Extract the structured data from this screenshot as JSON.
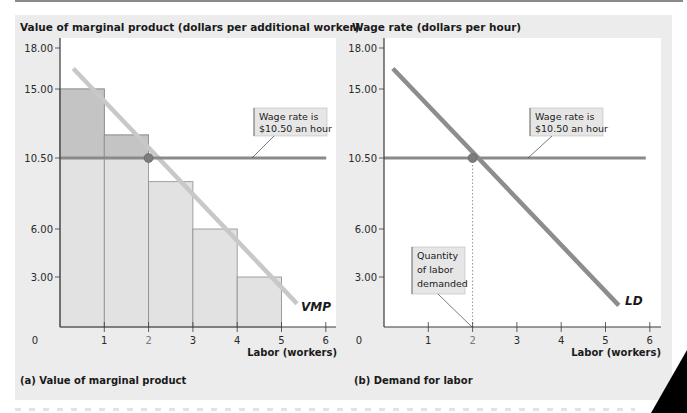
{
  "chart_data": [
    {
      "type": "bar",
      "panel_caption": "(a) Value of marginal product",
      "ylabel": "Value of marginal product (dollars per additional worker)",
      "xlabel": "Labor (workers)",
      "x_ticks": [
        "0",
        "1",
        "2",
        "3",
        "4",
        "5",
        "6"
      ],
      "y_ticks": [
        "3.00",
        "6.00",
        "10.50",
        "15.00",
        "18.00"
      ],
      "y_tick_values": [
        3,
        6,
        10.5,
        15,
        18
      ],
      "xlim": [
        0,
        6
      ],
      "ylim": [
        0,
        18
      ],
      "bars": {
        "x_start": [
          0,
          1,
          2,
          3,
          4
        ],
        "x_end": [
          1,
          2,
          3,
          4,
          5
        ],
        "values": [
          15,
          12,
          9,
          6,
          3
        ]
      },
      "series": [
        {
          "name": "VMP",
          "type": "line",
          "x": [
            0.3,
            5.35
          ],
          "y": [
            16.5,
            1.4
          ]
        },
        {
          "name": "Wage rate",
          "type": "hline",
          "y": 10.5,
          "x": [
            0,
            6.1
          ]
        }
      ],
      "equilibrium": {
        "x": 2,
        "y": 10.5
      },
      "annotations": [
        {
          "text_lines": [
            "Wage rate is",
            "$10.50 an hour"
          ],
          "points_to": {
            "x": 3.3,
            "y": 10.5
          }
        }
      ],
      "curve_label": "VMP"
    },
    {
      "type": "line",
      "panel_caption": "(b) Demand for labor",
      "ylabel": "Wage rate (dollars per hour)",
      "xlabel": "Labor (workers)",
      "x_ticks": [
        "0",
        "1",
        "2",
        "3",
        "4",
        "5",
        "6"
      ],
      "y_ticks": [
        "3.00",
        "6.00",
        "10.50",
        "15.00",
        "18.00"
      ],
      "y_tick_values": [
        3,
        6,
        10.5,
        15,
        18
      ],
      "xlim": [
        0,
        6
      ],
      "ylim": [
        0,
        18
      ],
      "series": [
        {
          "name": "LD",
          "type": "line",
          "x": [
            0.2,
            5.3
          ],
          "y": [
            16.5,
            1.3
          ]
        },
        {
          "name": "Wage rate",
          "type": "hline",
          "y": 10.5,
          "x": [
            0,
            6
          ]
        }
      ],
      "equilibrium": {
        "x": 2,
        "y": 10.5
      },
      "annotations": [
        {
          "text_lines": [
            "Wage rate is",
            "$10.50 an hour"
          ],
          "points_to": {
            "x": 3.3,
            "y": 10.5
          }
        },
        {
          "text_lines": [
            "Quantity",
            "of labor",
            "demanded"
          ],
          "points_to": {
            "x": 2,
            "y": 0
          }
        }
      ],
      "curve_label": "LD"
    }
  ],
  "colors": {
    "panel_bg": "#ececec",
    "plot_bg": "#ffffff",
    "bar_fill": "#e2e2e2",
    "bar_surplus_fill": "#c4c4c4",
    "bar_stroke": "#8c8c8c",
    "vmp_line": "#c8c8c8",
    "ld_line": "#8d8d8d",
    "wage_line": "#8a8a8a",
    "point": "#7c7c7c",
    "axis": "#3a3a3a",
    "label_box": "#e6e6e6"
  }
}
